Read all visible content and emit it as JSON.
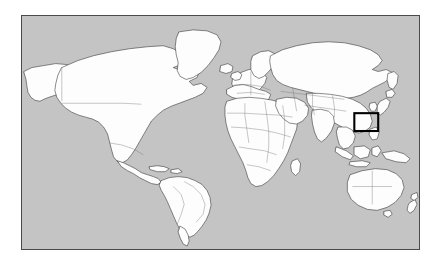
{
  "figure": {
    "kind": "world-map-locator",
    "background_color": "#ffffff"
  },
  "map": {
    "title": "",
    "projection": "equirectangular",
    "ocean_color": "#c4c4c4",
    "land_color": "#fdfdfd",
    "coastline_color": "#2b2b2b",
    "border_color": "#6f6f6f",
    "frame_color": "#4a4a4a",
    "frame": {
      "x": 21,
      "y": 15,
      "width": 399,
      "height": 235
    },
    "lon_range": [
      -180,
      180
    ],
    "lat_range": [
      -60,
      84
    ],
    "regions": [
      "North America",
      "South America",
      "Greenland",
      "Europe",
      "Africa",
      "Asia",
      "Australia",
      "New Zealand",
      "Indonesia",
      "Japan"
    ]
  },
  "highlight": {
    "label": "East Asia study area",
    "color": "#000000",
    "stroke_width": 2.1,
    "box_px": {
      "x": 356,
      "y": 114,
      "width": 24,
      "height": 18
    },
    "approx_lon_range": [
      116,
      138
    ],
    "approx_lat_range": [
      30,
      44
    ]
  },
  "legend": {
    "visible": false,
    "items": []
  },
  "chart_data": {
    "type": "map",
    "title": "",
    "xlabel": "",
    "ylabel": "",
    "xlim": [
      -180,
      180
    ],
    "ylim": [
      -60,
      84
    ],
    "grid": false,
    "legend_position": "none",
    "annotations": [
      {
        "kind": "rectangle",
        "name": "east-asia-inset-box",
        "lon_min": 116,
        "lon_max": 138,
        "lat_min": 30,
        "lat_max": 44,
        "stroke": "#000000"
      }
    ]
  }
}
